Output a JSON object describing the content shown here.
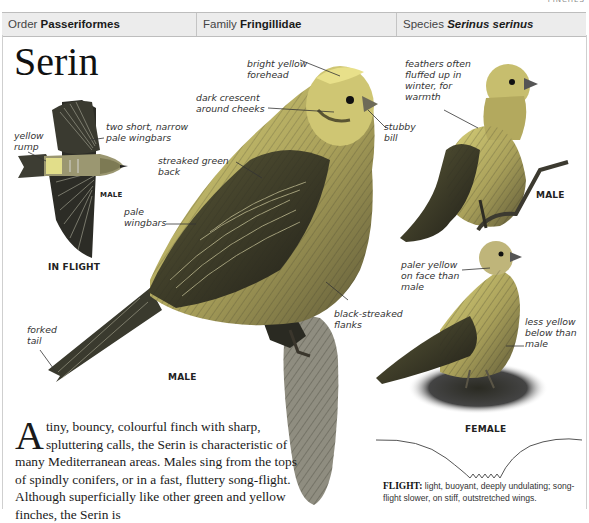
{
  "running_head": "FINCHES",
  "taxonomy": {
    "order": {
      "label": "Order",
      "value": "Passeriformes"
    },
    "family": {
      "label": "Family",
      "value": "Fringillidae"
    },
    "species": {
      "label": "Species",
      "value": "Serinus serinus"
    }
  },
  "title": "Serin",
  "in_flight": {
    "caption": "IN FLIGHT",
    "sex": "MALE",
    "labels": {
      "rump": [
        "yellow",
        "rump"
      ],
      "wingbars": [
        "two short, narrow",
        "pale wingbars"
      ]
    }
  },
  "main_male": {
    "caption": "MALE",
    "labels": {
      "forehead": [
        "bright yellow",
        "forehead"
      ],
      "cheeks": [
        "dark crescent",
        "around cheeks"
      ],
      "bill": [
        "stubby",
        "bill"
      ],
      "back": [
        "streaked green",
        "back"
      ],
      "wingbars": [
        "pale",
        "wingbars"
      ],
      "flanks": [
        "black-streaked",
        "flanks"
      ],
      "tail": [
        "forked",
        "tail"
      ]
    }
  },
  "winter_male": {
    "caption": "MALE",
    "labels": {
      "feathers": [
        "feathers often",
        "fluffed up in",
        "winter, for",
        "warmth"
      ]
    }
  },
  "female": {
    "caption": "FEMALE",
    "labels": {
      "face": [
        "paler yellow",
        "on face than",
        "male"
      ],
      "below": [
        "less yellow",
        "below than",
        "male"
      ]
    }
  },
  "flight_pattern": {
    "heading": "FLIGHT:",
    "text": "light, buoyant, deeply undulating; song-flight slower, on stiff, outstretched wings."
  },
  "description": {
    "dropcap": "A",
    "text": "tiny, bouncy, colourful finch with sharp, spluttering calls, the Serin is characteristic of many Mediterranean areas. Males sing from the tops of spindly conifers, or in a fast, fluttery song-flight. Although superficially like other green and yellow finches, the Serin is"
  },
  "colors": {
    "bar_bg": "#ececec",
    "bird_yellow": "#d8cf6a",
    "bird_olive": "#6e6a3c",
    "bird_dark": "#2d2b22"
  }
}
